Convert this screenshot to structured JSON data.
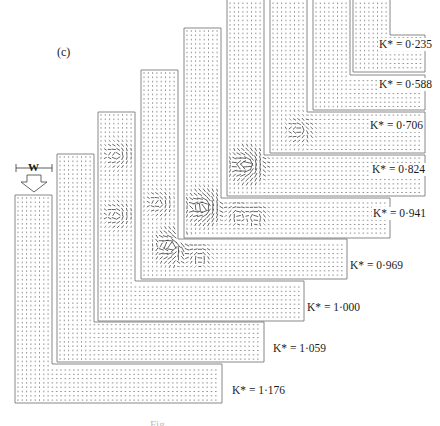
{
  "figure": {
    "subfigure_label": "(c)",
    "width_marker_label": "W",
    "inlet_arrow": "down-arrow",
    "caption_partial": "Fig. ...",
    "line_color": "#7a7a7a",
    "vector_color": "#3a3a3a",
    "panels": [
      {
        "label": "K* = 1·176",
        "param": "K*",
        "value": "1·176",
        "x": 15,
        "top": 195,
        "arm_top": 364,
        "arm_bottom": 403,
        "right": 222,
        "lx": 231,
        "ly": 384
      },
      {
        "label": "K* = 1·059",
        "param": "K*",
        "value": "1·059",
        "x": 57,
        "top": 154,
        "arm_top": 322,
        "arm_bottom": 362,
        "right": 264,
        "lx": 272,
        "ly": 342
      },
      {
        "label": "K* = 1·000",
        "param": "K*",
        "value": "1·000",
        "x": 98,
        "top": 112,
        "arm_top": 281,
        "arm_bottom": 321,
        "right": 304,
        "lx": 306,
        "ly": 301
      },
      {
        "label": "K* = 0·969",
        "param": "K*",
        "value": "0·969",
        "x": 141,
        "top": 70,
        "arm_top": 239,
        "arm_bottom": 279,
        "right": 347,
        "lx": 349,
        "ly": 259
      },
      {
        "label": "K* = 0·941",
        "param": "K*",
        "value": "0·941",
        "x": 184,
        "top": 28,
        "arm_top": 198,
        "arm_bottom": 238,
        "right": 390,
        "lx": 372,
        "ly": 207
      },
      {
        "label": "K* = 0·824",
        "param": "K*",
        "value": "0·824",
        "x": 227,
        "top": -5,
        "arm_top": 155,
        "arm_bottom": 196,
        "right": 425,
        "lx": 371,
        "ly": 163
      },
      {
        "label": "K* = 0·706",
        "param": "K*",
        "value": "0·706",
        "x": 270,
        "top": -5,
        "arm_top": 112,
        "arm_bottom": 153,
        "right": 425,
        "lx": 369,
        "ly": 119
      },
      {
        "label": "K* = 0·588",
        "param": "K*",
        "value": "0·588",
        "x": 313,
        "top": -5,
        "arm_top": 75,
        "arm_bottom": 110,
        "right": 425,
        "lx": 378,
        "ly": 78
      },
      {
        "label": "K* = 0·235",
        "param": "K*",
        "value": "0·235",
        "x": 353,
        "top": -5,
        "arm_top": 35,
        "arm_bottom": 72,
        "right": 425,
        "lx": 378,
        "ly": 38
      }
    ],
    "vortices": [
      {
        "cx": 173,
        "cy": 246,
        "r": 16,
        "strength": 2
      },
      {
        "cx": 205,
        "cy": 207,
        "r": 16,
        "strength": 2
      },
      {
        "cx": 248,
        "cy": 165,
        "r": 16,
        "strength": 2
      },
      {
        "cx": 160,
        "cy": 203,
        "r": 13,
        "strength": 1
      },
      {
        "cx": 200,
        "cy": 255,
        "r": 12,
        "strength": 1
      },
      {
        "cx": 118,
        "cy": 155,
        "r": 14,
        "strength": 1
      },
      {
        "cx": 118,
        "cy": 215,
        "r": 14,
        "strength": 1
      },
      {
        "cx": 238,
        "cy": 213,
        "r": 12,
        "strength": 1
      },
      {
        "cx": 300,
        "cy": 130,
        "r": 14,
        "strength": 1
      },
      {
        "cx": 256,
        "cy": 215,
        "r": 12,
        "strength": 1
      }
    ]
  }
}
